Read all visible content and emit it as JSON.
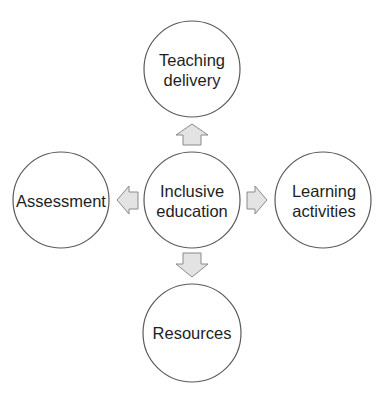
{
  "diagram": {
    "type": "hub-and-spoke",
    "center": {
      "id": "inclusive-education",
      "lines": [
        "Inclusive",
        "education"
      ]
    },
    "nodes": [
      {
        "id": "teaching-delivery",
        "position": "top",
        "lines": [
          "Teaching",
          "delivery"
        ]
      },
      {
        "id": "learning-activities",
        "position": "right",
        "lines": [
          "Learning",
          "activities"
        ]
      },
      {
        "id": "resources",
        "position": "bottom",
        "lines": [
          "Resources"
        ]
      },
      {
        "id": "assessment",
        "position": "left",
        "lines": [
          "Assessment"
        ]
      }
    ],
    "edges": [
      {
        "from": "inclusive-education",
        "to": "teaching-delivery",
        "direction": "up"
      },
      {
        "from": "inclusive-education",
        "to": "learning-activities",
        "direction": "right"
      },
      {
        "from": "inclusive-education",
        "to": "resources",
        "direction": "down"
      },
      {
        "from": "inclusive-education",
        "to": "assessment",
        "direction": "left"
      }
    ],
    "colors": {
      "circle_stroke": "#5a5a5a",
      "arrow_fill": "#e3e3e3",
      "arrow_stroke": "#8a8a8a",
      "text": "#1e1e1e",
      "background": "#ffffff"
    }
  }
}
